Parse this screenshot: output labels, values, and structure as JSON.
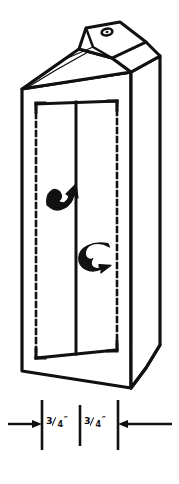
{
  "figure": {
    "background_color": "#ffffff",
    "ink_color": "#111111",
    "line_style_solid": "solid cut line",
    "line_style_dashed": "dashed fold line"
  },
  "carton": {
    "body_label": "carton-body",
    "top_label": "gable-top",
    "spout_hole_label": "spout-hole",
    "front_panel_label": "front-panel",
    "center_fold_label": "center-fold-line",
    "left_fold_label": "left-dashed-fold-line",
    "right_fold_label": "right-dashed-fold-line",
    "side_panel_label": "right-side-panel",
    "base_label": "carton-base"
  },
  "annotations": {
    "arrows": [
      {
        "name": "fold-arrow-upper",
        "direction": "curves left then points up-right",
        "glyph": "curved-arrow-icon"
      },
      {
        "name": "fold-arrow-lower",
        "direction": "curves right then points down-left",
        "glyph": "curved-arrow-icon"
      }
    ]
  },
  "dimensions": {
    "unit_mark": "″",
    "items": [
      {
        "name": "dimension-left",
        "numerator": "3",
        "denominator": "4",
        "unit": "″",
        "text": "3/4″"
      },
      {
        "name": "dimension-right",
        "numerator": "3",
        "denominator": "4",
        "unit": "″",
        "text": "3/4″"
      }
    ],
    "extension_ticks": 3,
    "arrow_left_direction": "right",
    "arrow_right_direction": "left"
  }
}
